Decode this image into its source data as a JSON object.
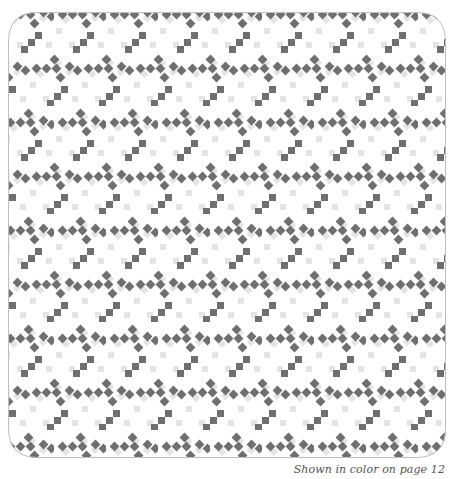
{
  "quilt": {
    "label": "quilt-pattern-illustration",
    "colors": {
      "dark": "#6f6f6f",
      "light": "#e4e4e4",
      "background": "#ffffff",
      "border": "#bdbdbd"
    },
    "tile": {
      "width": 52,
      "height": 54
    },
    "corner_style": "chamfered-rounded"
  },
  "caption": {
    "text": "Shown in color on page 12"
  }
}
